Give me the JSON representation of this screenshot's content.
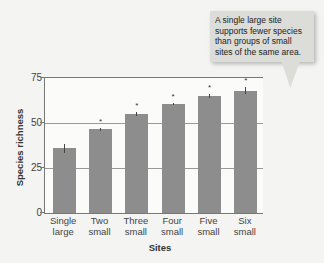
{
  "chart_data": {
    "type": "bar",
    "title": "",
    "xlabel": "Sites",
    "ylabel": "Species richness",
    "ylim": [
      0,
      75
    ],
    "yticks": [
      0,
      25,
      50,
      75
    ],
    "grid": "horizontal",
    "categories": [
      "Single large",
      "Two small",
      "Three small",
      "Four small",
      "Five small",
      "Six small"
    ],
    "category_lines": [
      [
        "Single",
        "large"
      ],
      [
        "Two",
        "small"
      ],
      [
        "Three",
        "small"
      ],
      [
        "Four",
        "small"
      ],
      [
        "Five",
        "small"
      ],
      [
        "Six",
        "small"
      ]
    ],
    "values": [
      36,
      46.5,
      55,
      60.5,
      65,
      68
    ],
    "errors": [
      2.5,
      0.8,
      1.2,
      0.5,
      1.2,
      1.8
    ],
    "significance": [
      "",
      "*",
      "*",
      "*",
      "*",
      "*"
    ],
    "annotation": "A single large site supports fewer species than groups of small sites of the same area.",
    "bar_color": "#8d8d8d"
  },
  "callout": {
    "text": "A single large site supports fewer species than groups of small sites of the same area."
  },
  "axes": {
    "xlabel": "Sites",
    "ylabel": "Species richness",
    "yticks": [
      "0",
      "25",
      "50",
      "75"
    ]
  }
}
